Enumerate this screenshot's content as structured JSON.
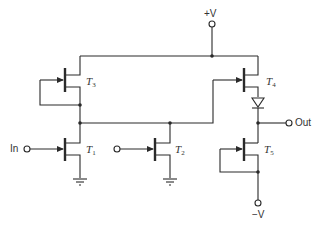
{
  "diagram": {
    "type": "circuit-schematic",
    "supply_positive_label": "+V",
    "supply_negative_label": "−V",
    "input_label": "In",
    "output_label": "Out",
    "transistors": [
      {
        "id": "T3",
        "name": "T",
        "sub": "3",
        "role": "depletion load"
      },
      {
        "id": "T4",
        "name": "T",
        "sub": "4",
        "role": "source follower"
      },
      {
        "id": "T1",
        "name": "T",
        "sub": "1",
        "role": "input driver"
      },
      {
        "id": "T2",
        "name": "T",
        "sub": "2",
        "role": "driver"
      },
      {
        "id": "T5",
        "name": "T",
        "sub": "5",
        "role": "current source"
      }
    ],
    "components": [
      "diode",
      "ground",
      "ground"
    ],
    "colors": {
      "line": "#2a2a2a",
      "background": "#ffffff"
    }
  }
}
